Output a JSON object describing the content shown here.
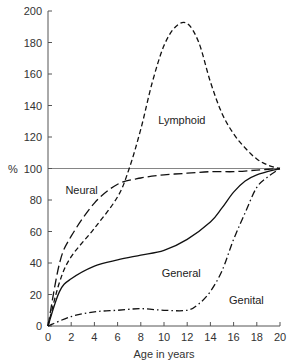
{
  "chart_data": {
    "type": "line",
    "title": "",
    "xlabel": "Age in years",
    "ylabel": "%",
    "xlim": [
      0,
      20
    ],
    "ylim": [
      0,
      200
    ],
    "xticks": [
      0,
      2,
      4,
      6,
      8,
      10,
      12,
      14,
      16,
      18,
      20
    ],
    "yticks": [
      0,
      20,
      40,
      60,
      80,
      100,
      120,
      140,
      160,
      180,
      200
    ],
    "grid": false,
    "reference_line": {
      "y": 100
    },
    "legend": "inline labels",
    "series": [
      {
        "name": "Lymphoid",
        "style": "short-dash",
        "label_pos": [
          9.5,
          128
        ],
        "x": [
          0,
          1,
          2,
          4,
          6,
          7,
          8,
          9,
          10,
          11,
          12,
          13,
          14,
          15,
          16,
          17,
          18,
          19,
          20
        ],
        "values": [
          0,
          28,
          44,
          62,
          82,
          100,
          125,
          155,
          178,
          190,
          192,
          180,
          155,
          135,
          122,
          113,
          106,
          102,
          100
        ]
      },
      {
        "name": "Neural",
        "style": "long-dash",
        "label_pos": [
          1.5,
          84
        ],
        "x": [
          0,
          1,
          2,
          4,
          6,
          8,
          10,
          12,
          14,
          16,
          18,
          20
        ],
        "values": [
          0,
          40,
          57,
          78,
          90,
          94,
          96,
          97,
          98,
          98,
          99,
          100
        ]
      },
      {
        "name": "General",
        "style": "solid",
        "label_pos": [
          9.8,
          31
        ],
        "x": [
          0,
          1,
          2,
          4,
          6,
          8,
          10,
          12,
          14,
          15,
          16,
          17,
          18,
          20
        ],
        "values": [
          0,
          22,
          30,
          38,
          42,
          45,
          48,
          55,
          66,
          75,
          85,
          92,
          96,
          100
        ]
      },
      {
        "name": "Genital",
        "style": "dash-dot",
        "label_pos": [
          15.6,
          14
        ],
        "x": [
          0,
          2,
          4,
          6,
          8,
          10,
          12,
          13,
          14,
          15,
          16,
          17,
          18,
          19,
          20
        ],
        "values": [
          0,
          6,
          9,
          10,
          11,
          10,
          10,
          14,
          22,
          35,
          55,
          72,
          88,
          95,
          100
        ]
      }
    ]
  }
}
